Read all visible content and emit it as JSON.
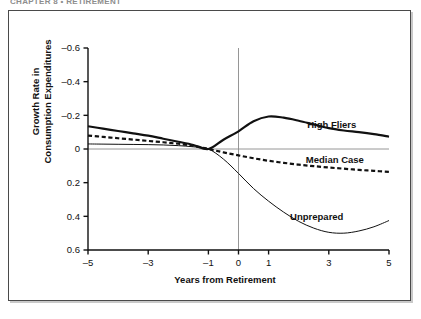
{
  "page": {
    "running_head": "CHAPTER 8 • RETIREMENT"
  },
  "figure": {
    "xlabel": "Years from Retirement",
    "ylabel_line1": "Growth Rate in",
    "ylabel_line2": "Consumption Expenditures"
  },
  "axis": {
    "y_ticks": [
      "0.6",
      "0.4",
      "0.2",
      "0",
      "–0.2",
      "–0.4",
      "–0.6"
    ],
    "x_ticks": [
      "–5",
      "–3",
      "–1",
      "0",
      "1",
      "3",
      "5"
    ]
  },
  "labels": {
    "high_fliers": "High Fliers",
    "median_case": "Median Case",
    "unprepared": "Unprepared"
  },
  "colors": {
    "ink": "#111111",
    "frame": "#4a4a4a",
    "rule": "#8a8a8a"
  },
  "chart_data": {
    "type": "line",
    "title": "",
    "xlabel": "Years from Retirement",
    "ylabel": "Growth Rate in Consumption Expenditures",
    "xlim": [
      -5,
      5
    ],
    "ylim": [
      -0.6,
      0.6
    ],
    "xticks": [
      -5,
      -3,
      -1,
      0,
      1,
      3,
      5
    ],
    "yticks": [
      -0.6,
      -0.4,
      -0.2,
      0,
      0.2,
      0.4,
      0.6
    ],
    "grid": false,
    "legend": "inline-right",
    "annotations": [
      {
        "text": "High Fliers",
        "x": 3.1,
        "y": 0.145
      },
      {
        "text": "Median Case",
        "x": 3.2,
        "y": -0.06
      },
      {
        "text": "Unprepared",
        "x": 2.6,
        "y": -0.4
      }
    ],
    "reference_lines": [
      {
        "orientation": "vertical",
        "x": 0
      },
      {
        "orientation": "horizontal",
        "y": 0
      }
    ],
    "x": [
      -5,
      -4.5,
      -4,
      -3.5,
      -3,
      -2.5,
      -2,
      -1.5,
      -1,
      -0.5,
      0,
      0.5,
      1,
      1.5,
      2,
      2.5,
      3,
      3.5,
      4,
      4.5,
      5
    ],
    "series": [
      {
        "name": "High Fliers",
        "style": "solid-thick",
        "values": [
          0.135,
          0.121,
          0.107,
          0.093,
          0.079,
          0.061,
          0.043,
          0.024,
          0.0,
          0.055,
          0.105,
          0.165,
          0.193,
          0.186,
          0.168,
          0.146,
          0.124,
          0.11,
          0.1,
          0.088,
          0.073
        ]
      },
      {
        "name": "Median Case",
        "style": "dashed",
        "values": [
          0.08,
          0.072,
          0.064,
          0.056,
          0.048,
          0.04,
          0.031,
          0.019,
          0.0,
          -0.02,
          -0.038,
          -0.055,
          -0.07,
          -0.082,
          -0.093,
          -0.102,
          -0.11,
          -0.117,
          -0.124,
          -0.13,
          -0.136
        ]
      },
      {
        "name": "Unprepared",
        "style": "solid-thin",
        "values": [
          0.03,
          0.029,
          0.028,
          0.027,
          0.026,
          0.024,
          0.02,
          0.013,
          0.0,
          -0.06,
          -0.145,
          -0.235,
          -0.31,
          -0.375,
          -0.43,
          -0.47,
          -0.495,
          -0.5,
          -0.487,
          -0.462,
          -0.425
        ]
      }
    ]
  }
}
